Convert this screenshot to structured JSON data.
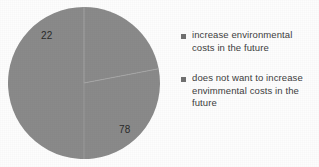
{
  "chart_data": {
    "type": "pie",
    "title": "",
    "subtitle": "",
    "xlabel": "",
    "ylabel": "",
    "grid": false,
    "legend_position": "right",
    "categories": [
      "increase environmental costs in the future",
      "does not want to increase envimmental costs in the future"
    ],
    "values": [
      22,
      78
    ],
    "value_labels": [
      "22",
      "78"
    ],
    "slice_color": "#8a8a8a",
    "divider_color": "#a6a6a6",
    "legend_marker_color": "#707070",
    "background_color": "#fdfdfd",
    "label_color": "#2a2a2a",
    "legend_text_color": "#404040"
  },
  "legend": {
    "entries": [
      {
        "label": "increase environmental costs in the future",
        "marker": "square-marker"
      },
      {
        "label": "does not want to increase envimmental costs in the future",
        "marker": "square-marker"
      }
    ]
  },
  "labels": {
    "slice_0": "22",
    "slice_1": "78"
  }
}
